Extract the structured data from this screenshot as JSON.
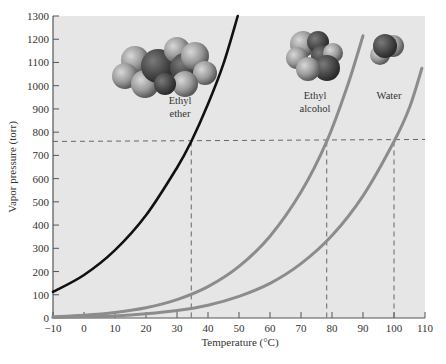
{
  "chart_data": {
    "type": "line",
    "title": "",
    "xlabel": "Temperature (°C)",
    "ylabel": "Vapor pressure (torr)",
    "xlim": [
      -10,
      110
    ],
    "ylim": [
      0,
      1300
    ],
    "xticks": [
      -10,
      0,
      10,
      20,
      30,
      40,
      50,
      60,
      70,
      80,
      90,
      100,
      110
    ],
    "yticks": [
      0,
      100,
      200,
      300,
      400,
      500,
      600,
      700,
      800,
      900,
      1000,
      1100,
      1200,
      1300
    ],
    "grid": false,
    "legend": "none (inline molecule labels)",
    "series": [
      {
        "name": "Ethyl ether",
        "color": "#111111",
        "x": [
          -10,
          0,
          10,
          20,
          30,
          34.6,
          40,
          45,
          49.6
        ],
        "y": [
          112,
          185,
          292,
          442,
          647,
          760,
          921,
          1095,
          1300
        ]
      },
      {
        "name": "Ethyl alcohol",
        "color": "#8c8c8c",
        "x": [
          -10,
          0,
          10,
          20,
          30,
          40,
          50,
          60,
          70,
          78.3,
          85,
          90
        ],
        "y": [
          5,
          12,
          24,
          44,
          79,
          135,
          222,
          352,
          542,
          760,
          1000,
          1215
        ]
      },
      {
        "name": "Water",
        "color": "#8c8c8c",
        "x": [
          -10,
          0,
          10,
          20,
          30,
          40,
          50,
          60,
          70,
          80,
          90,
          100,
          105,
          109
        ],
        "y": [
          2,
          5,
          9,
          18,
          32,
          55,
          93,
          149,
          234,
          355,
          526,
          760,
          906,
          1075
        ]
      }
    ],
    "annotations": [
      {
        "type": "hline",
        "y": 760,
        "style": "dashed",
        "label": "1 atm (760 torr)"
      },
      {
        "type": "vline",
        "x": 34.6,
        "y_to": 760,
        "style": "dashed",
        "label": "Ethyl ether normal boiling point"
      },
      {
        "type": "vline",
        "x": 78.3,
        "y_to": 760,
        "style": "dashed",
        "label": "Ethyl alcohol normal boiling point"
      },
      {
        "type": "vline",
        "x": 100,
        "y_to": 760,
        "style": "dashed",
        "label": "Water normal boiling point"
      }
    ],
    "molecule_labels": [
      {
        "text_line1": "Ethyl",
        "text_line2": "ether"
      },
      {
        "text_line1": "Ethyl",
        "text_line2": "alcohol"
      },
      {
        "text_line1": "",
        "text_line2": "Water"
      }
    ]
  },
  "labels": {
    "xlabel": "Temperature (°C)",
    "ylabel": "Vapor pressure (torr)",
    "ether_1": "Ethyl",
    "ether_2": "ether",
    "alcohol_1": "Ethyl",
    "alcohol_2": "alcohol",
    "water": "Water"
  },
  "colors": {
    "plot_bg": "#e6e6e6",
    "axis": "#555555",
    "ether_curve": "#111111",
    "alcohol_curve": "#8c8c8c",
    "water_curve": "#8c8c8c",
    "dashed": "#666666"
  }
}
